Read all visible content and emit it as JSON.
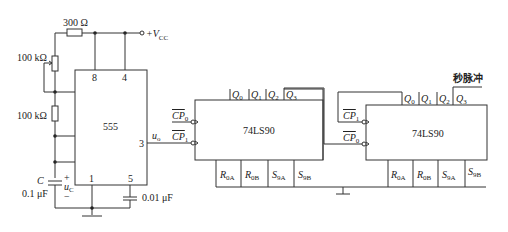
{
  "components": {
    "r_top": {
      "label": "300 Ω"
    },
    "vcc": {
      "label": "+V",
      "sub": "CC"
    },
    "pot": {
      "label": "100 kΩ"
    },
    "r_bottom": {
      "label": "100 kΩ"
    },
    "cap_timing": {
      "name": "C",
      "value": "0.1 μF",
      "voltage": "u",
      "voltage_sub": "C",
      "plus": "+",
      "minus": "−"
    },
    "cap_control": {
      "value": "0.01 μF"
    },
    "timer": {
      "name": "555",
      "pins": {
        "p8": "8",
        "p4": "4",
        "p7": "7",
        "p6": "6",
        "p2": "2",
        "p1": "1",
        "p5": "5",
        "p3": "3"
      },
      "output": "u",
      "output_sub": "o"
    },
    "counter1": {
      "name": "74LS90",
      "outputs": [
        {
          "n": "Q",
          "s": "0"
        },
        {
          "n": "Q",
          "s": "1"
        },
        {
          "n": "Q",
          "s": "2"
        },
        {
          "n": "Q",
          "s": "3"
        }
      ],
      "clock_top": {
        "n": "CP",
        "s": "0"
      },
      "clock_bottom": {
        "n": "CP",
        "s": "1"
      },
      "resets": [
        {
          "n": "R",
          "s": "0A"
        },
        {
          "n": "R",
          "s": "0B"
        },
        {
          "n": "S",
          "s": "9A"
        },
        {
          "n": "S",
          "s": "9B"
        }
      ]
    },
    "counter2": {
      "name": "74LS90",
      "outputs": [
        {
          "n": "Q",
          "s": "0"
        },
        {
          "n": "Q",
          "s": "1"
        },
        {
          "n": "Q",
          "s": "2"
        },
        {
          "n": "Q",
          "s": "3"
        }
      ],
      "clock_top": {
        "n": "CP",
        "s": "1"
      },
      "clock_bottom": {
        "n": "CP",
        "s": "0"
      },
      "resets": [
        {
          "n": "R",
          "s": "0A"
        },
        {
          "n": "R",
          "s": "0B"
        },
        {
          "n": "S",
          "s": "9A"
        },
        {
          "n": "S",
          "s": "9B"
        }
      ]
    },
    "output_label": "秒脉冲"
  }
}
